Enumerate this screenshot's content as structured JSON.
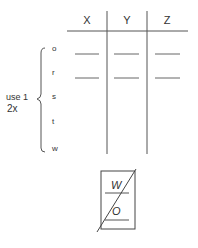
{
  "table": {
    "columns": [
      "X",
      "Y",
      "Z"
    ],
    "rows": [
      "o",
      "r",
      "s",
      "t",
      "w"
    ],
    "blank_rows": [
      "o",
      "r"
    ]
  },
  "brace_note": {
    "line1": "use 1",
    "line2": "2x"
  },
  "fraction_box": {
    "top": "W",
    "bottom": "O"
  },
  "colors": {
    "line": "#555555",
    "background": "#ffffff"
  }
}
